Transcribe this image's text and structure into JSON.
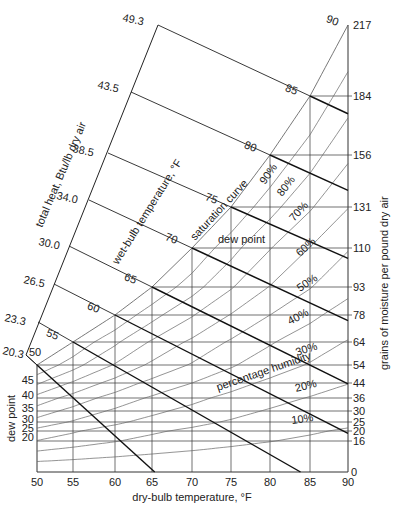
{
  "chart_data": {
    "type": "line",
    "xlabel": "dry-bulb temperature, °F",
    "ylabel_right": "grains of moisture per pound dry air",
    "ylabel_left": "dew point",
    "slant_axis_label": "total heat, Btu/lb dry air",
    "wetbulb_label": "wet-bulb temperature, °F",
    "saturation_label": "saturation curve",
    "dewpoint_label": "dew point",
    "humidity_label": "percentage humidity",
    "x_ticks": [
      50,
      55,
      60,
      65,
      70,
      75,
      80,
      85,
      90
    ],
    "xlim": [
      50,
      90
    ],
    "right_ticks": [
      217,
      184,
      156,
      131,
      110,
      93,
      78,
      64,
      54,
      44,
      36,
      30,
      25,
      20,
      16,
      0
    ],
    "dewpoint_ticks": [
      50,
      45,
      40,
      35,
      30,
      25,
      20
    ],
    "total_heat_ticks": [
      49.3,
      43.5,
      38.5,
      34.0,
      30.0,
      26.5,
      23.3,
      20.3
    ],
    "wetbulb_ticks": [
      90,
      85,
      80,
      75,
      70,
      65,
      60,
      55,
      50
    ],
    "humidity_curves": [
      "90%",
      "80%",
      "70%",
      "60%",
      "50%",
      "40%",
      "30%",
      "20%",
      "10%"
    ],
    "saturation_points": [
      {
        "drybulb": 50,
        "grains": 54
      },
      {
        "drybulb": 55,
        "grains": 64
      },
      {
        "drybulb": 60,
        "grains": 78
      },
      {
        "drybulb": 65,
        "grains": 93
      },
      {
        "drybulb": 70,
        "grains": 110
      },
      {
        "drybulb": 75,
        "grains": 131
      },
      {
        "drybulb": 80,
        "grains": 156
      },
      {
        "drybulb": 85,
        "grains": 184
      },
      {
        "drybulb": 90,
        "grains": 217
      }
    ]
  },
  "labels": {
    "x_axis": "dry-bulb temperature, °F",
    "right_axis": "grains of moisture per pound dry air",
    "dew_point_axis": "dew point",
    "total_heat": "total heat, Btu/lb dry air",
    "wet_bulb": "wet-bulb temperature, °F",
    "saturation": "saturation curve",
    "dew_point": "dew point",
    "humidity": "percentage humidity"
  }
}
